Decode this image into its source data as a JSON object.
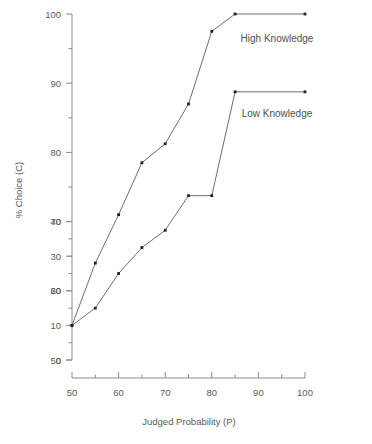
{
  "chart_data": {
    "type": "line",
    "title": "",
    "xlabel": "Judged Probability (P)",
    "ylabel": "% Choice (C)",
    "x": [
      50,
      55,
      60,
      65,
      70,
      75,
      80,
      85,
      100
    ],
    "series": [
      {
        "name": "High Knowledge",
        "values": [
          10,
          28,
          42,
          57,
          62.5,
          74,
          95,
          100,
          100
        ]
      },
      {
        "name": "Low Knowledge",
        "values": [
          10,
          15,
          25,
          32.5,
          37.5,
          47.5,
          47.5,
          77.5,
          77.5
        ]
      }
    ],
    "xlim": [
      50,
      100
    ],
    "ylim": [
      0,
      100
    ],
    "x_ticks_major": [
      50,
      60,
      70,
      80,
      90,
      100
    ],
    "x_tick_labels": [
      "50",
      "60",
      "70",
      "80",
      "90",
      "100"
    ],
    "x_ticks_minor": [
      55,
      65,
      75,
      85,
      95
    ],
    "y_ticks_major": [
      0,
      10,
      20,
      30,
      40,
      50,
      60,
      70,
      80,
      90,
      100
    ],
    "y_tick_labels": [
      "0",
      "10",
      "20",
      "30",
      "40",
      "50",
      "60",
      "70",
      "80",
      "90",
      "100"
    ],
    "y_ticks_minor": [
      5,
      15,
      25,
      35,
      45,
      55,
      65,
      75,
      85,
      95
    ],
    "grid": false,
    "legend_position": "inline-annotations",
    "annotations": [
      {
        "text": "High Knowledge",
        "x": 88,
        "y": 93
      },
      {
        "text": "Low Knowledge",
        "x": 88,
        "y": 71
      }
    ],
    "colors": {
      "line": "#5e5e5e",
      "marker": "#1f1f1f",
      "axis": "#8a8a8a",
      "text": "#5a5a5a",
      "background": "#ffffff"
    }
  }
}
